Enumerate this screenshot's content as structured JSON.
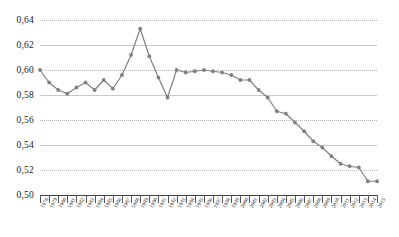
{
  "chart_data": {
    "type": "line",
    "title": "",
    "subtitle": "",
    "xlabel": "",
    "ylabel": "",
    "xlim": [
      1978,
      2015
    ],
    "ylim": [
      0.5,
      0.64
    ],
    "grid": true,
    "legend": null,
    "legend_position": "none",
    "decimal_separator": ",",
    "marker": "circle",
    "series_color": "#808080",
    "gridline_color": "#c9c9c9",
    "axis_color": "#444444",
    "y_ticks": [
      0.64,
      0.62,
      0.6,
      0.58,
      0.56,
      0.54,
      0.52,
      0.5
    ],
    "y_tick_labels": [
      "0,64",
      "0,62",
      "0,60",
      "0,58",
      "0,56",
      "0,54",
      "0,52",
      "0,50"
    ],
    "categories": [
      "1978",
      "1979",
      "1980",
      "1981",
      "1982",
      "1983",
      "1984",
      "1985",
      "1986",
      "1987",
      "1988",
      "1989",
      "1990",
      "1991",
      "1992",
      "1993",
      "1994",
      "1995",
      "1996",
      "1997",
      "1998",
      "1999",
      "2000",
      "2001",
      "2002",
      "2003",
      "2004",
      "2005",
      "2006",
      "2007",
      "2008",
      "2009",
      "2010",
      "2011",
      "2012",
      "2013",
      "2014",
      "2015"
    ],
    "values": [
      0.6,
      0.59,
      0.584,
      0.581,
      0.586,
      0.59,
      0.584,
      0.592,
      0.585,
      0.596,
      0.612,
      0.633,
      0.611,
      0.594,
      0.578,
      0.6,
      0.598,
      0.599,
      0.6,
      0.599,
      0.598,
      0.596,
      0.592,
      0.592,
      0.584,
      0.578,
      0.567,
      0.565,
      0.558,
      0.551,
      0.543,
      0.538,
      0.531,
      0.525,
      0.523,
      0.522,
      0.511,
      0.511
    ],
    "ylabel_format": "0,00"
  }
}
